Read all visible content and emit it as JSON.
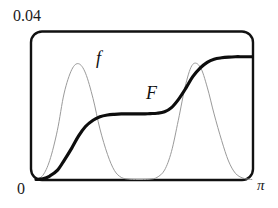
{
  "figure": {
    "name": "function-and-antiderivative-plot",
    "background_color": "#ffffff"
  },
  "labels": {
    "y_max": "0.04",
    "origin": "0",
    "x_max": "π",
    "f_curve": "f",
    "F_curve": "F"
  },
  "chart_data": {
    "type": "line",
    "title": "",
    "subtitle": "",
    "xlabel": "",
    "ylabel": "",
    "xlim": [
      0,
      3.14159
    ],
    "ylim": [
      0,
      0.04
    ],
    "xtick_labels": [
      "0",
      "π"
    ],
    "ytick_labels": [
      "0",
      "0.04"
    ],
    "grid": false,
    "legend": "inline-annotations",
    "annotations": [
      {
        "text": "f",
        "x": 0.93,
        "y": 0.0305,
        "style": "italic"
      },
      {
        "text": "F",
        "x": 1.7,
        "y": 0.0237,
        "style": "italic"
      }
    ],
    "frame": {
      "style": "rounded-rectangle",
      "corner_radius_px": 11,
      "stroke": "#111111",
      "stroke_width_px": 2.4
    },
    "series": [
      {
        "name": "f",
        "role": "integrand",
        "color": "#9a9a9a",
        "stroke_width_px": 1.0,
        "description": "two smooth bumps returning to zero between them and at both ends",
        "x": [
          0.0,
          0.1,
          0.2,
          0.31,
          0.41,
          0.52,
          0.62,
          0.72,
          0.83,
          0.93,
          1.04,
          1.14,
          1.24,
          1.35,
          1.45,
          1.56,
          1.66,
          1.76,
          1.87,
          1.97,
          2.07,
          2.18,
          2.28,
          2.39,
          2.49,
          2.59,
          2.7,
          2.8,
          2.9,
          3.01,
          3.14
        ],
        "y": [
          0.0,
          0.0012,
          0.0055,
          0.014,
          0.0248,
          0.0315,
          0.0332,
          0.0305,
          0.0232,
          0.0145,
          0.0072,
          0.0026,
          0.0006,
          0.0001,
          0.0,
          0.0,
          0.0001,
          0.0006,
          0.0027,
          0.008,
          0.017,
          0.0275,
          0.033,
          0.0322,
          0.0265,
          0.0188,
          0.0112,
          0.0053,
          0.0018,
          0.0004,
          0.0
        ]
      },
      {
        "name": "F",
        "role": "antiderivative",
        "color": "#0d0d0d",
        "stroke_width_px": 3.2,
        "description": "cumulative integral of f: rises from 0, plateaus near 0.018 mid-domain, rises again to about 0.035",
        "x": [
          0.0,
          0.1,
          0.2,
          0.31,
          0.41,
          0.52,
          0.62,
          0.72,
          0.83,
          0.93,
          1.04,
          1.14,
          1.24,
          1.35,
          1.45,
          1.56,
          1.66,
          1.76,
          1.87,
          1.97,
          2.07,
          2.18,
          2.28,
          2.39,
          2.49,
          2.59,
          2.7,
          2.8,
          2.9,
          3.01,
          3.14
        ],
        "y": [
          0.0,
          0.0002,
          0.001,
          0.0026,
          0.0055,
          0.009,
          0.0125,
          0.0152,
          0.017,
          0.018,
          0.0185,
          0.0187,
          0.0188,
          0.0188,
          0.0188,
          0.0188,
          0.0189,
          0.019,
          0.0194,
          0.0206,
          0.0229,
          0.0262,
          0.0295,
          0.032,
          0.0336,
          0.0345,
          0.0349,
          0.0351,
          0.0352,
          0.0352,
          0.0352
        ]
      }
    ]
  }
}
